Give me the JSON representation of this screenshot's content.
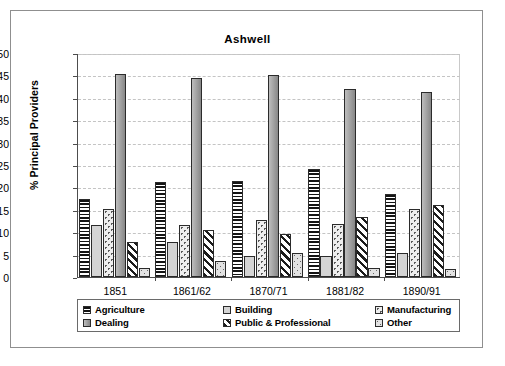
{
  "chart_data": {
    "type": "bar",
    "title": "Ashwell",
    "xlabel": "",
    "ylabel": "% Principal Providers",
    "ylim": [
      0,
      50
    ],
    "yticks": [
      0,
      5,
      10,
      15,
      20,
      25,
      30,
      35,
      40,
      45,
      50
    ],
    "grid": true,
    "legend_position": "bottom",
    "categories": [
      "1851",
      "1861/62",
      "1870/71",
      "1881/82",
      "1890/91"
    ],
    "series": [
      {
        "name": "Agriculture",
        "pattern": "horizontal-stripes",
        "values": [
          17.5,
          21.3,
          21.5,
          24.1,
          18.6
        ]
      },
      {
        "name": "Building",
        "pattern": "solid-light-gray",
        "values": [
          11.7,
          7.9,
          4.8,
          4.7,
          5.4
        ]
      },
      {
        "name": "Manufacturing",
        "pattern": "dotted",
        "values": [
          15.1,
          11.6,
          12.7,
          11.9,
          15.2
        ]
      },
      {
        "name": "Dealing",
        "pattern": "solid-gray",
        "values": [
          45.4,
          44.4,
          45.1,
          42.0,
          41.2
        ]
      },
      {
        "name": "Public & Professional",
        "pattern": "diagonal-hatch",
        "values": [
          7.9,
          10.6,
          9.7,
          13.5,
          16.0
        ]
      },
      {
        "name": "Other",
        "pattern": "light-dotted",
        "values": [
          2.1,
          3.5,
          5.4,
          2.0,
          1.9
        ]
      }
    ]
  },
  "legend": {
    "items": [
      {
        "label": "Agriculture"
      },
      {
        "label": "Building"
      },
      {
        "label": "Manufacturing"
      },
      {
        "label": "Dealing"
      },
      {
        "label": "Public & Professional"
      },
      {
        "label": "Other"
      }
    ]
  },
  "colors": {
    "axis": "#4d4d4d",
    "grid": "#c4c4c4",
    "border": "#8f8f8f",
    "dealing": "#9a9a9a",
    "building": "#d4d4d4",
    "background": "#ffffff"
  }
}
